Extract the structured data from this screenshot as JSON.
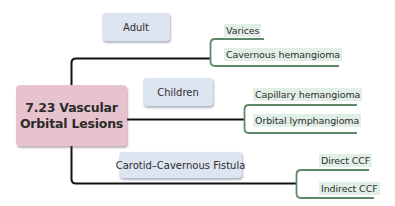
{
  "diagram": {
    "root": {
      "line1": "7.23 Vascular",
      "line2": "Orbital Lesions"
    },
    "categories": [
      {
        "label": "Adult",
        "children": [
          "Varices",
          "Cavernous hemangioma"
        ]
      },
      {
        "label": "Children",
        "children": [
          "Capillary hemangioma",
          "Orbital lymphangioma"
        ]
      },
      {
        "label": "Carotid–Cavernous Fistula",
        "children": [
          "Direct CCF",
          "Indirect CCF"
        ]
      }
    ],
    "colors": {
      "root_fill": "#e7c4cd",
      "category_fill": "#dde5f1",
      "leaf_fill": "#e2efe7",
      "trunk_line": "#111111",
      "bracket_line": "#5f8a6a"
    }
  }
}
